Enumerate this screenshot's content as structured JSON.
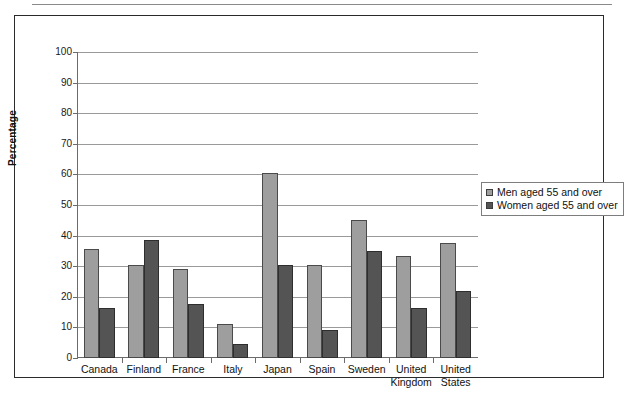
{
  "chart_data": {
    "type": "bar",
    "title": "",
    "xlabel": "",
    "ylabel": "Percentage",
    "ylim": [
      0,
      100
    ],
    "yticks": [
      0,
      10,
      20,
      30,
      40,
      50,
      60,
      70,
      80,
      90,
      100
    ],
    "grid": true,
    "legend_position": "right",
    "categories": [
      "Canada",
      "Finland",
      "France",
      "Italy",
      "Japan",
      "Spain",
      "Sweden",
      "United\nKingdom",
      "United\nStates"
    ],
    "series": [
      {
        "name": "Men aged 55 and over",
        "color": "#9e9e9e",
        "values": [
          35.5,
          30.5,
          29,
          11,
          60.5,
          30.5,
          45,
          33.5,
          37.5
        ]
      },
      {
        "name": "Women aged 55 and over",
        "color": "#545454",
        "values": [
          16.5,
          38.5,
          17.5,
          4.5,
          30.5,
          9,
          35,
          16.5,
          22
        ]
      }
    ]
  },
  "legend": {
    "items": [
      {
        "label": "Men aged 55 and over",
        "swatch": "men"
      },
      {
        "label": "Women aged 55 and over",
        "swatch": "women"
      }
    ]
  }
}
